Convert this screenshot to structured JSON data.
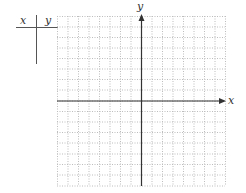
{
  "t_table": {
    "col_x_header": "x",
    "col_y_header": "y",
    "rows": []
  },
  "graph": {
    "x_axis_label": "x",
    "y_axis_label": "y",
    "grid_columns": 16,
    "grid_rows": 16,
    "grid_line_style": "dotted",
    "grid_color": "#bbbbbb",
    "axis_color": "#333333"
  }
}
